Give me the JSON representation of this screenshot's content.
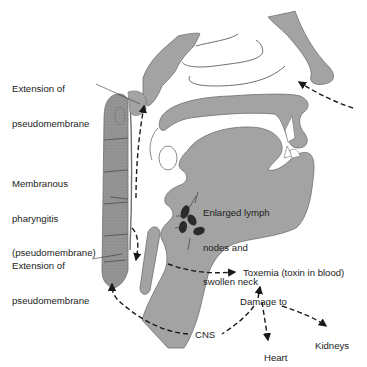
{
  "figure": {
    "caption_fragment": "Figure 22.1  Pathogenesis of ...",
    "colors": {
      "tissue": "#a3a3a3",
      "tissue_outline": "#6e6e6e",
      "arrow": "#1a1a1a",
      "text": "#222222",
      "background": "#ffffff",
      "lymph_node": "#2b2b2b"
    }
  },
  "labels": {
    "extension_top": {
      "line1": "Extension of",
      "line2": "pseudomembrane"
    },
    "pharyngitis": {
      "line1": "Membranous",
      "line2": "pharyngitis",
      "line3": "(pseudomembrane)"
    },
    "extension_bottom": {
      "line1": "Extension of",
      "line2": "pseudomembrane"
    },
    "lymph": {
      "line1": "Enlarged lymph",
      "line2": "nodes and",
      "line3": "swollen neck"
    },
    "toxemia": "Toxemia (toxin in blood)",
    "damage_to": "Damage to",
    "cns": "CNS",
    "heart": "Heart",
    "kidneys": "Kidneys"
  },
  "flow": [
    {
      "from": "nose",
      "to": "nasopharynx",
      "style": "dashed"
    },
    {
      "from": "pharynx",
      "to": "extension_top",
      "style": "dashed"
    },
    {
      "from": "pharynx",
      "to": "extension_bottom",
      "style": "dashed"
    },
    {
      "from": "neck",
      "to": "toxemia",
      "style": "dashed"
    },
    {
      "from": "damage_to",
      "to": "toxemia",
      "style": "dashed"
    },
    {
      "from": "damage_to",
      "to": "cns",
      "style": "dashed"
    },
    {
      "from": "damage_to",
      "to": "heart",
      "style": "dashed"
    },
    {
      "from": "damage_to",
      "to": "kidneys",
      "style": "dashed"
    },
    {
      "from": "cns",
      "to": "extension_bottom",
      "style": "dashed"
    }
  ]
}
